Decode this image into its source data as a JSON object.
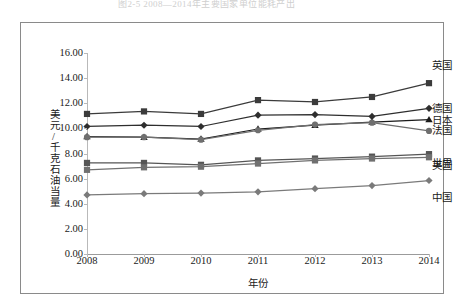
{
  "page": {
    "cut_off_header_text": "图2-5  2008—2014年主要国家单位能耗产出"
  },
  "chart": {
    "xlabel": "年份",
    "ylabel": "美元/千克石油当量",
    "y_ticks": [
      "0.00",
      "2.00",
      "4.00",
      "6.00",
      "8.00",
      "10.00",
      "12.00",
      "14.00",
      "16.00"
    ],
    "x_ticks": [
      "2008",
      "2009",
      "2010",
      "2011",
      "2012",
      "2013",
      "2014"
    ]
  },
  "chart_data": {
    "type": "line",
    "title": "",
    "xlabel": "年份",
    "ylabel": "美元/千克石油当量",
    "x": [
      2008,
      2009,
      2010,
      2011,
      2012,
      2013,
      2014
    ],
    "categories": [
      "2008",
      "2009",
      "2010",
      "2011",
      "2012",
      "2013",
      "2014"
    ],
    "ylim": [
      0.0,
      16.0
    ],
    "ytick_step": 2.0,
    "grid": false,
    "legend_position": "right-of-plot-inline-labels",
    "series": [
      {
        "name": "英国",
        "label": "英国",
        "color": "#3b3b3b",
        "marker": "square",
        "values": [
          11.15,
          11.35,
          11.15,
          12.25,
          12.1,
          12.5,
          13.6
        ]
      },
      {
        "name": "德国",
        "label": "德国",
        "color": "#2e2e2e",
        "marker": "diamond",
        "values": [
          10.15,
          10.25,
          10.15,
          11.05,
          11.1,
          10.95,
          11.6
        ]
      },
      {
        "name": "日本",
        "label": "日本",
        "color": "#1a1a1a",
        "marker": "triangle",
        "values": [
          9.35,
          9.3,
          9.15,
          9.95,
          10.25,
          10.5,
          10.7
        ]
      },
      {
        "name": "法国",
        "label": "法国",
        "color": "#6f6f6f",
        "marker": "circle",
        "values": [
          9.3,
          9.3,
          9.1,
          9.85,
          10.3,
          10.45,
          9.8
        ]
      },
      {
        "name": "世界",
        "label": "世界",
        "color": "#555555",
        "marker": "square",
        "values": [
          7.25,
          7.25,
          7.1,
          7.45,
          7.6,
          7.75,
          7.95
        ]
      },
      {
        "name": "美国",
        "label": "美国",
        "color": "#707070",
        "marker": "square",
        "values": [
          6.7,
          6.9,
          6.95,
          7.2,
          7.45,
          7.6,
          7.7
        ]
      },
      {
        "name": "中国",
        "label": "中国",
        "color": "#7a7a7a",
        "marker": "diamond",
        "values": [
          4.7,
          4.8,
          4.85,
          4.95,
          5.2,
          5.45,
          5.85
        ]
      }
    ]
  }
}
